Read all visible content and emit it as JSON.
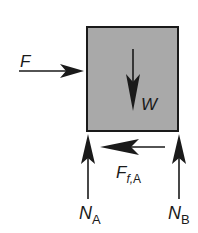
{
  "diagram": {
    "type": "free-body-diagram",
    "colors": {
      "block_fill": "#a9a9a9",
      "block_stroke": "#1a1a1a",
      "arrow": "#1a1a1a",
      "background": "#ffffff"
    },
    "block": {
      "label": "block"
    },
    "forces": {
      "applied": {
        "symbol": "F",
        "direction": "right"
      },
      "weight": {
        "symbol": "W",
        "direction": "down"
      },
      "friction": {
        "symbol": "F",
        "subscript": "f,A",
        "direction": "left"
      },
      "normal_a": {
        "symbol": "N",
        "subscript": "A",
        "direction": "up"
      },
      "normal_b": {
        "symbol": "N",
        "subscript": "B",
        "direction": "up"
      }
    }
  }
}
